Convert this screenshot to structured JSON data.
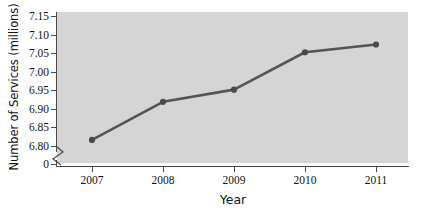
{
  "chart_data": {
    "type": "line",
    "title": "",
    "xlabel": "Year",
    "ylabel": "Number of Services (millions)",
    "categories": [
      "2007",
      "2008",
      "2009",
      "2010",
      "2011"
    ],
    "x": [
      2007,
      2008,
      2009,
      2010,
      2011
    ],
    "values": [
      6.815,
      6.918,
      6.951,
      7.052,
      7.073
    ],
    "series": [
      {
        "name": "Number of Services",
        "values": [
          6.815,
          6.918,
          6.951,
          7.052,
          7.073
        ]
      }
    ],
    "ylim": [
      6.8,
      7.15
    ],
    "xlim": [
      2006.5,
      2011.5
    ],
    "y_tick_labels": [
      "7.15",
      "7.10",
      "7.05",
      "7.00",
      "6.95",
      "6.90",
      "6.85",
      "6.80",
      "0"
    ],
    "y_tick_values": [
      7.15,
      7.1,
      7.05,
      7.0,
      6.95,
      6.9,
      6.85,
      6.8,
      0
    ],
    "x_tick_labels": [
      "2007",
      "2008",
      "2009",
      "2010",
      "2011"
    ],
    "grid": false,
    "legend": "none",
    "axis_break": true,
    "axis_break_label": "0",
    "marker": "circle",
    "colors": {
      "line": "#555555",
      "marker": "#4a4a4a",
      "plot_background": "#d5d5d5",
      "axis": "#4a4a4a",
      "text": "#111111",
      "page_background": "#ffffff"
    }
  },
  "axes": {
    "y_title": "Number of Services (millions)",
    "x_title": "Year",
    "y_labels": [
      {
        "text": "7.15",
        "top": 11
      },
      {
        "text": "7.10",
        "top": 29
      },
      {
        "text": "7.05",
        "top": 48
      },
      {
        "text": "7.00",
        "top": 66
      },
      {
        "text": "6.95",
        "top": 85
      },
      {
        "text": "6.90",
        "top": 103
      },
      {
        "text": "6.85",
        "top": 122
      },
      {
        "text": "6.80",
        "top": 140
      },
      {
        "text": "0",
        "top": 158
      }
    ],
    "x_labels": [
      {
        "text": "2007",
        "left": 70
      },
      {
        "text": "2008",
        "left": 141
      },
      {
        "text": "2009",
        "left": 212
      },
      {
        "text": "2010",
        "left": 283
      },
      {
        "text": "2011",
        "left": 354
      }
    ]
  }
}
